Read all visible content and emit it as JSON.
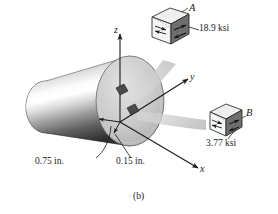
{
  "figure": {
    "caption": "(b)",
    "axes": [
      {
        "name": "z-axis",
        "label": "z"
      },
      {
        "name": "y-axis",
        "label": "y"
      },
      {
        "name": "x-axis",
        "label": "x"
      }
    ],
    "dimensions": [
      {
        "name": "outer-radius",
        "label": "0.75 in."
      },
      {
        "name": "inner-offset",
        "label": "0.15 in."
      }
    ],
    "stress_elements": [
      {
        "id": "A",
        "label": "A",
        "value": "18.9 ksi",
        "shaded_face": "right",
        "arrow_direction": "shear-pair"
      },
      {
        "id": "B",
        "label": "B",
        "value": "3.77 ksi",
        "shaded_face": "right",
        "arrow_direction": "shear-pair"
      }
    ],
    "colors": {
      "line": "#1a1a1a",
      "cylinder_light": "#ffffff",
      "cylinder_mid": "#9a9a9a",
      "cylinder_dark": "#2b2b2b",
      "face_fill": "#c9c9c9",
      "back_ellipse": "#2e2e2e",
      "ribbon": "#d4d4d4",
      "cube_face_dark": "#6e6e6e",
      "cube_face_light": "#efefef",
      "element_patch": "#4a4a4a"
    }
  }
}
